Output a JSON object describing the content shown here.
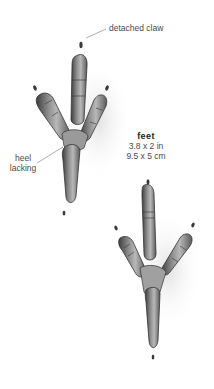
{
  "illustration": {
    "subject": "bird footprints",
    "tracks": [
      {
        "name": "upper-footprint",
        "position": "upper-left"
      },
      {
        "name": "lower-footprint",
        "position": "lower-right"
      }
    ]
  },
  "annotations": {
    "detached_claw": "detached claw",
    "heel_line1": "heel",
    "heel_line2": "lacking"
  },
  "caption": {
    "title": "feet",
    "size_imperial": "3.8 x 2 in",
    "size_metric": "9.5 x 5 cm"
  },
  "colors": {
    "ink": "#3a3a3a",
    "shade": "#8a8a8a",
    "background": "#ffffff"
  }
}
